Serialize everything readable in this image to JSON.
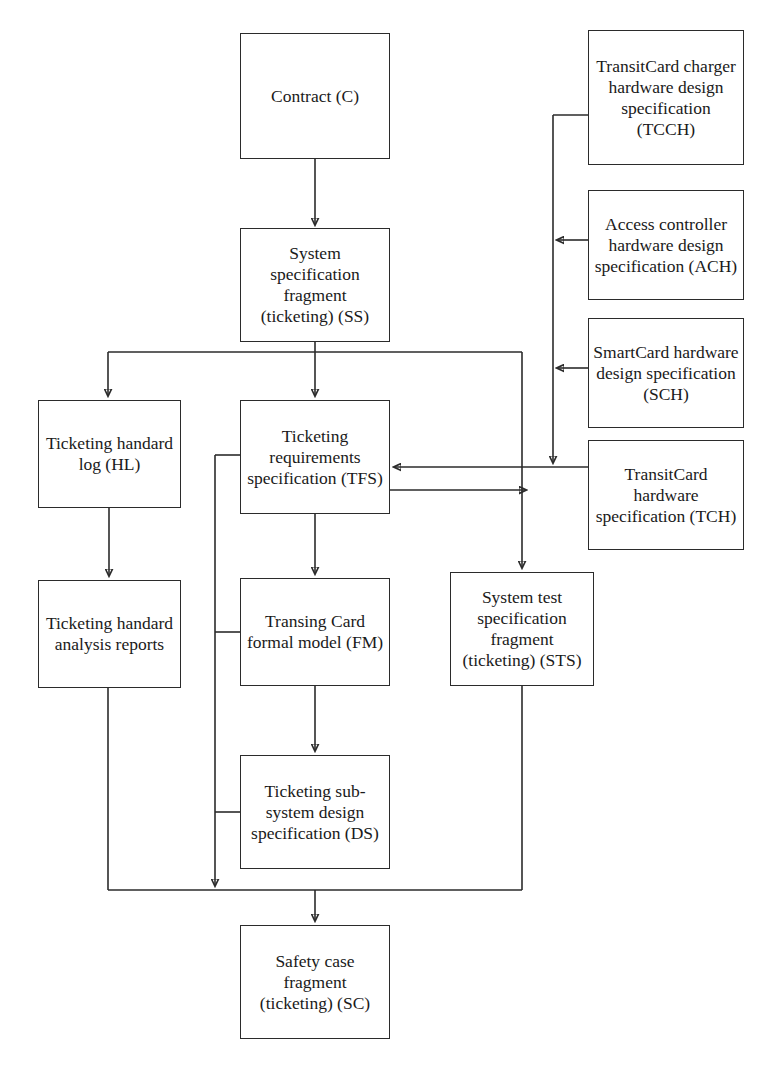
{
  "diagram": {
    "type": "flowchart",
    "title": "",
    "nodes": [
      {
        "id": "C",
        "label": "Contract (C)",
        "x": 240,
        "y": 33,
        "w": 150,
        "h": 126
      },
      {
        "id": "TCCH",
        "label": "TransitCard charger hardware design specification (TCCH)",
        "x": 588,
        "y": 30,
        "w": 156,
        "h": 135
      },
      {
        "id": "ACH",
        "label": "Access controller hardware design specification (ACH)",
        "x": 588,
        "y": 190,
        "w": 156,
        "h": 110
      },
      {
        "id": "SCH",
        "label": "SmartCard hardware design specification (SCH)",
        "x": 588,
        "y": 318,
        "w": 156,
        "h": 110
      },
      {
        "id": "SS",
        "label": "System specification fragment (ticketing) (SS)",
        "x": 240,
        "y": 228,
        "w": 150,
        "h": 114
      },
      {
        "id": "TCH",
        "label": "TransitCard hardware specification (TCH)",
        "x": 588,
        "y": 440,
        "w": 156,
        "h": 110
      },
      {
        "id": "HL",
        "label": "Ticketing handard log (HL)",
        "x": 38,
        "y": 400,
        "w": 143,
        "h": 108
      },
      {
        "id": "TFS",
        "label": "Ticketing requirements specification (TFS)",
        "x": 240,
        "y": 400,
        "w": 150,
        "h": 114
      },
      {
        "id": "HAR",
        "label": "Ticketing handard analysis reports",
        "x": 38,
        "y": 580,
        "w": 143,
        "h": 108
      },
      {
        "id": "FM",
        "label": "Transing Card formal model (FM)",
        "x": 240,
        "y": 578,
        "w": 150,
        "h": 108
      },
      {
        "id": "STS",
        "label": "System test specification fragment (ticketing) (STS)",
        "x": 450,
        "y": 572,
        "w": 144,
        "h": 114
      },
      {
        "id": "DS",
        "label": "Ticketing sub-system design specification (DS)",
        "x": 240,
        "y": 755,
        "w": 150,
        "h": 114
      },
      {
        "id": "SC",
        "label": "Safety case fragment (ticketing) (SC)",
        "x": 240,
        "y": 925,
        "w": 150,
        "h": 114
      }
    ],
    "edges": [
      {
        "from": "C",
        "to": "SS",
        "kind": "vertical-arrow"
      },
      {
        "from": "SS",
        "to": "HL",
        "kind": "fan-out-arrow"
      },
      {
        "from": "SS",
        "to": "TFS",
        "kind": "vertical-arrow"
      },
      {
        "from": "SS",
        "to": "STS",
        "kind": "fan-out-arrow"
      },
      {
        "from": "HL",
        "to": "HAR",
        "kind": "vertical-arrow"
      },
      {
        "from": "TFS",
        "to": "FM",
        "kind": "vertical-arrow"
      },
      {
        "from": "FM",
        "to": "DS",
        "kind": "vertical-arrow"
      },
      {
        "from": "TCCH",
        "to": "TFS",
        "kind": "right-bus-arrow"
      },
      {
        "from": "ACH",
        "to": "TFS",
        "kind": "right-bus-arrow"
      },
      {
        "from": "SCH",
        "to": "TFS",
        "kind": "right-bus-arrow"
      },
      {
        "from": "TCH",
        "to": "TFS",
        "kind": "horizontal-arrow"
      },
      {
        "from": "TFS",
        "to": "STS",
        "kind": "horizontal-arrow"
      },
      {
        "from": "TFS",
        "to": "SC",
        "kind": "left-bus-merge"
      },
      {
        "from": "FM",
        "to": "SC",
        "kind": "left-bus-merge"
      },
      {
        "from": "DS",
        "to": "SC",
        "kind": "left-bus-merge"
      },
      {
        "from": "HAR",
        "to": "SC",
        "kind": "merge-arrow"
      },
      {
        "from": "STS",
        "to": "SC",
        "kind": "merge-arrow"
      }
    ],
    "colors": {
      "stroke": "#2b2b2b",
      "fill": "#ffffff",
      "text": "#1a1a1a"
    }
  }
}
